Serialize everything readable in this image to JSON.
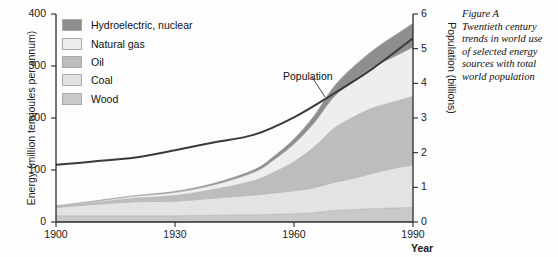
{
  "caption": {
    "title": "Figure A",
    "lines": [
      "Figure A",
      "Twentieth century",
      "trends in world use",
      "of selected energy",
      "sources with total",
      "world population"
    ]
  },
  "legend": {
    "position": "top-left-inside",
    "items": [
      {
        "label": "Hydroelectric, nuclear",
        "color": "#8e8e8e"
      },
      {
        "label": "Natural gas",
        "color": "#eeeeee"
      },
      {
        "label": "Oil",
        "color": "#bdbdbd"
      },
      {
        "label": "Coal",
        "color": "#e3e3e3"
      },
      {
        "label": "Wood",
        "color": "#c9c9c9"
      }
    ]
  },
  "chart_data": {
    "type": "area",
    "stacked": true,
    "title": "",
    "xlabel": "Year",
    "ylabel": "Energy (million terajoules per annum)",
    "y2label": "Population (billions)",
    "xlim": [
      1900,
      1990
    ],
    "ylim": [
      0,
      400
    ],
    "y2lim": [
      0,
      6
    ],
    "xticks": [
      1900,
      1930,
      1960,
      1990
    ],
    "yticks": [
      0,
      100,
      200,
      300,
      400
    ],
    "y2ticks": [
      0,
      1,
      2,
      3,
      4,
      5,
      6
    ],
    "grid": false,
    "x": [
      1900,
      1910,
      1920,
      1930,
      1940,
      1950,
      1955,
      1960,
      1965,
      1970,
      1975,
      1980,
      1985,
      1990
    ],
    "series": [
      {
        "name": "Wood",
        "color": "#c9c9c9",
        "stack_order": 1,
        "values": [
          12,
          12,
          12,
          12,
          13,
          14,
          15,
          16,
          18,
          22,
          24,
          26,
          27,
          28
        ]
      },
      {
        "name": "Coal",
        "color": "#e3e3e3",
        "stack_order": 2,
        "values": [
          16,
          22,
          27,
          28,
          33,
          38,
          41,
          44,
          48,
          54,
          60,
          68,
          76,
          82
        ]
      },
      {
        "name": "Oil",
        "color": "#bdbdbd",
        "stack_order": 3,
        "values": [
          2,
          4,
          7,
          11,
          17,
          28,
          40,
          56,
          78,
          104,
          118,
          126,
          128,
          132
        ]
      },
      {
        "name": "Natural gas",
        "color": "#eeeeee",
        "stack_order": 4,
        "values": [
          1,
          2,
          4,
          6,
          9,
          16,
          24,
          34,
          46,
          60,
          70,
          78,
          86,
          94
        ]
      },
      {
        "name": "Hydroelectric, nuclear",
        "color": "#8e8e8e",
        "stack_order": 5,
        "values": [
          0,
          1,
          1,
          2,
          3,
          5,
          7,
          10,
          14,
          20,
          27,
          33,
          40,
          46
        ]
      }
    ],
    "overlay_series": [
      {
        "name": "Population",
        "axis": "right",
        "color": "#3a3a3a",
        "label": "Population",
        "unit": "billions",
        "x": [
          1900,
          1910,
          1920,
          1930,
          1940,
          1950,
          1960,
          1970,
          1980,
          1990
        ],
        "values": [
          1.65,
          1.75,
          1.86,
          2.07,
          2.3,
          2.52,
          3.02,
          3.7,
          4.44,
          5.3
        ]
      }
    ],
    "annotations": [
      {
        "text": "Population",
        "x": 1962,
        "y2": 4.5
      }
    ]
  }
}
